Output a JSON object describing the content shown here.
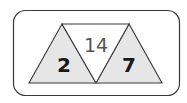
{
  "diagram": {
    "type": "number-triangle-fact-family",
    "product": "14",
    "factor_left": "2",
    "factor_right": "7",
    "colors": {
      "outline": "#3a3a3a",
      "fill_shaded": "#e6e6e6",
      "fill_center": "#ffffff",
      "text_product": "#555555",
      "text_factor": "#1a1a1a"
    }
  }
}
